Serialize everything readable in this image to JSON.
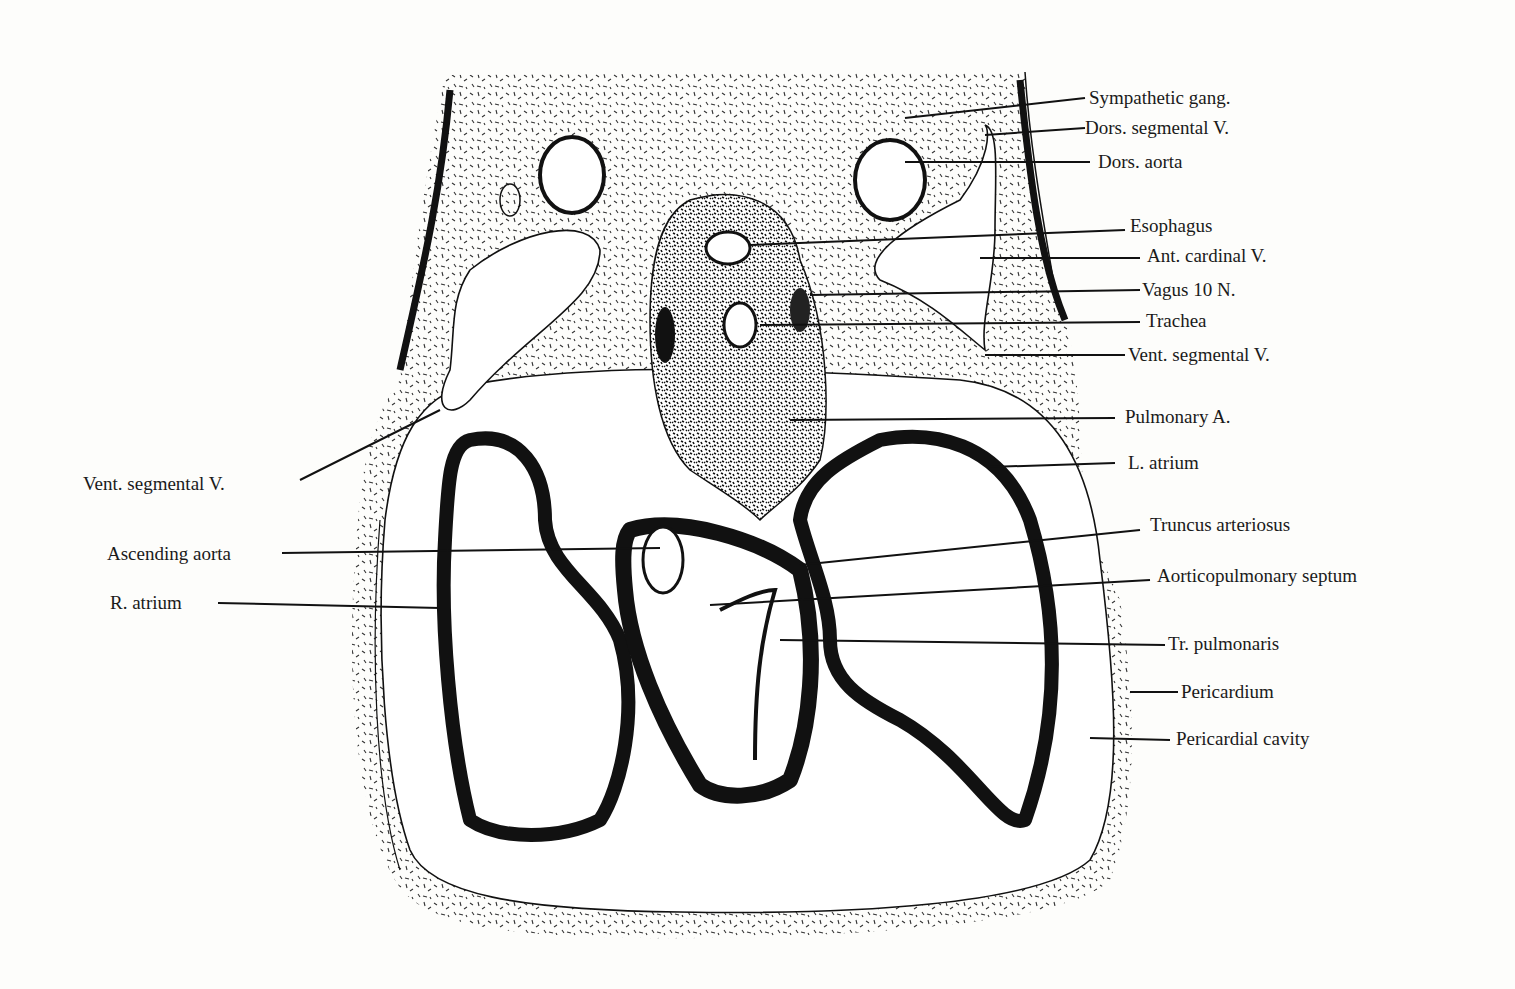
{
  "figure": {
    "ink_color": "#1a1a1a",
    "paper_color": "#fdfdfb"
  },
  "labels": {
    "right": [
      {
        "id": "sympathetic_gang",
        "text": "Sympathetic gang."
      },
      {
        "id": "dors_segmental_v",
        "text": "Dors. segmental V."
      },
      {
        "id": "dors_aorta",
        "text": "Dors. aorta"
      },
      {
        "id": "esophagus",
        "text": "Esophagus"
      },
      {
        "id": "ant_cardinal_v",
        "text": "Ant. cardinal V."
      },
      {
        "id": "vagus",
        "text": "Vagus 10 N."
      },
      {
        "id": "trachea",
        "text": "Trachea"
      },
      {
        "id": "vent_segmental_v_right",
        "text": "Vent. segmental V."
      },
      {
        "id": "pulmonary_a",
        "text": "Pulmonary A."
      },
      {
        "id": "l_atrium",
        "text": "L. atrium"
      },
      {
        "id": "truncus_arteriosus",
        "text": "Truncus arteriosus"
      },
      {
        "id": "aorticopulmonary_septum",
        "text": "Aorticopulmonary septum"
      },
      {
        "id": "tr_pulmonaris",
        "text": "Tr. pulmonaris"
      },
      {
        "id": "pericardium",
        "text": "Pericardium"
      },
      {
        "id": "pericardial_cavity",
        "text": "Pericardial cavity"
      }
    ],
    "left": [
      {
        "id": "vent_segmental_v_left",
        "text": "Vent. segmental V."
      },
      {
        "id": "ascending_aorta",
        "text": "Ascending aorta"
      },
      {
        "id": "r_atrium",
        "text": "R. atrium"
      }
    ]
  }
}
